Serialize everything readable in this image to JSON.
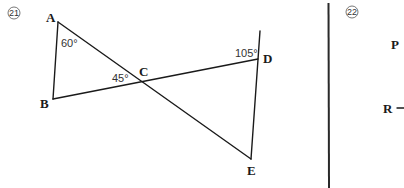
{
  "problems": [
    {
      "number": "21",
      "figure": {
        "points": {
          "A": {
            "label": "A",
            "x": 58,
            "y": 22
          },
          "B": {
            "label": "B",
            "x": 53,
            "y": 99
          },
          "C": {
            "label": "C",
            "x": 142,
            "y": 82
          },
          "D": {
            "label": "D",
            "x": 258,
            "y": 59
          },
          "E": {
            "label": "E",
            "x": 251,
            "y": 159
          }
        },
        "angles": [
          {
            "vertex": "A",
            "value": "60°"
          },
          {
            "vertex": "C",
            "value": "45°"
          },
          {
            "vertex": "D",
            "value": "105°"
          }
        ]
      }
    },
    {
      "number": "22",
      "labels": {
        "P": "P",
        "R": "R"
      }
    }
  ],
  "colors": {
    "ink": "#1a1a1a",
    "background": "#ffffff"
  }
}
